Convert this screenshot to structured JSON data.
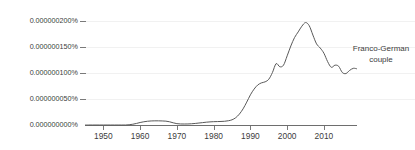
{
  "chart_data": {
    "type": "line",
    "title": "",
    "xlabel": "",
    "ylabel": "",
    "grid": true,
    "legend_position": "inline-right",
    "annotations": [
      {
        "name": "series-label",
        "line1": "Franco-German",
        "line2": "couple"
      }
    ],
    "series_color": "#595959",
    "xlim": [
      1945,
      2019
    ],
    "ylim": [
      0,
      2e-07
    ],
    "xticks": [
      1950,
      1960,
      1970,
      1980,
      1990,
      2000,
      2010
    ],
    "xticklabels": [
      "1950",
      "1960",
      "1970",
      "1980",
      "1990",
      "2000",
      "2010"
    ],
    "yticks": [
      0,
      5e-08,
      1e-07,
      1.5e-07,
      2e-07
    ],
    "yticklabels": [
      "0.000000000%",
      "0.000000050%",
      "0.000000100%",
      "0.000000150%",
      "0.000000200%"
    ],
    "series": [
      {
        "name": "Franco-German couple",
        "x": [
          1945,
          1946,
          1947,
          1948,
          1949,
          1950,
          1951,
          1952,
          1953,
          1954,
          1955,
          1956,
          1957,
          1958,
          1959,
          1960,
          1961,
          1962,
          1963,
          1964,
          1965,
          1966,
          1967,
          1968,
          1969,
          1970,
          1971,
          1972,
          1973,
          1974,
          1975,
          1976,
          1977,
          1978,
          1979,
          1980,
          1981,
          1982,
          1983,
          1984,
          1985,
          1986,
          1987,
          1988,
          1989,
          1990,
          1991,
          1992,
          1993,
          1994,
          1995,
          1996,
          1997,
          1998,
          1999,
          2000,
          2001,
          2002,
          2003,
          2004,
          2005,
          2006,
          2007,
          2008,
          2009,
          2010,
          2011,
          2012,
          2013,
          2014,
          2015,
          2016,
          2017,
          2018,
          2019
        ],
        "values": [
          0,
          0,
          0,
          0,
          0,
          0,
          0,
          0,
          0,
          0,
          0,
          0,
          5e-10,
          1.5e-09,
          3e-09,
          4.8e-09,
          6.2e-09,
          7.2e-09,
          7.8e-09,
          8e-09,
          8e-09,
          7.8e-09,
          7.4e-09,
          6.2e-09,
          4.2e-09,
          2.6e-09,
          2e-09,
          1.9e-09,
          2e-09,
          2.4e-09,
          3e-09,
          3.8e-09,
          4.6e-09,
          5.4e-09,
          6e-09,
          6.4e-09,
          6.6e-09,
          6.8e-09,
          7.2e-09,
          8.2e-09,
          1e-08,
          1.4e-08,
          2.1e-08,
          3.1e-08,
          4.4e-08,
          5.8e-08,
          6.9e-08,
          7.7e-08,
          8.1e-08,
          8.3e-08,
          8.8e-08,
          1.01e-07,
          1.18e-07,
          1.12e-07,
          1.15e-07,
          1.33e-07,
          1.52e-07,
          1.68e-07,
          1.79e-07,
          1.9e-07,
          1.97e-07,
          1.91e-07,
          1.73e-07,
          1.56e-07,
          1.48e-07,
          1.38e-07,
          1.22e-07,
          1.11e-07,
          1.15e-07,
          1.13e-07,
          1.01e-07,
          9.9e-08,
          1.05e-07,
          1.09e-07,
          1.08e-07
        ]
      }
    ]
  }
}
